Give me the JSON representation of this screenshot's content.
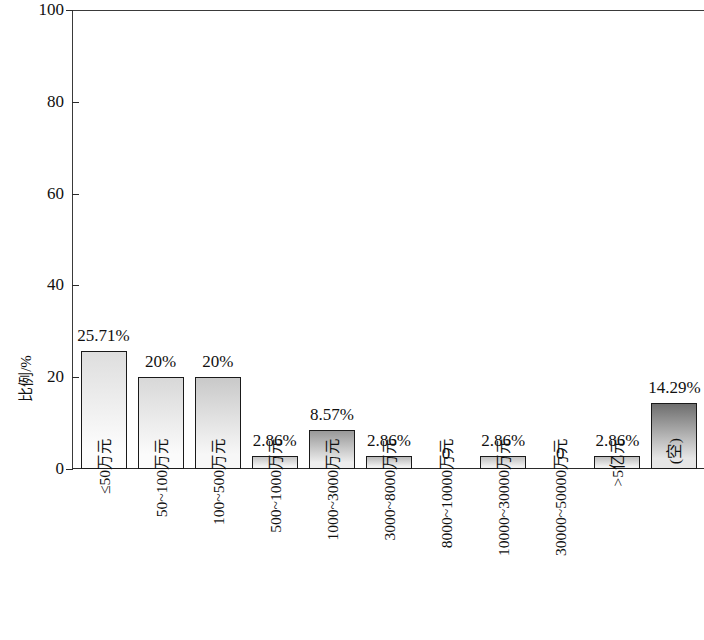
{
  "chart_data": {
    "type": "bar",
    "title": "",
    "xlabel": "",
    "ylabel": "比例/%",
    "ylim": [
      0,
      100
    ],
    "yticks": [
      0,
      20,
      40,
      60,
      80,
      100
    ],
    "grid": false,
    "legend": "none",
    "categories": [
      "≤50万元",
      "50~100万元",
      "100~500万元",
      "500~1000万元",
      "1000~3000万元",
      "3000~8000万元",
      "8000~10000万元",
      "10000~30000万元",
      "30000~50000万元",
      ">5亿元",
      "(空)"
    ],
    "values": [
      25.71,
      20,
      20,
      2.86,
      8.57,
      2.86,
      0,
      2.86,
      0,
      2.86,
      14.29
    ],
    "data_labels": [
      "25.71%",
      "20%",
      "20%",
      "2.86%",
      "8.57%",
      "2.86%",
      "0",
      "2.86%",
      "0",
      "2.86%",
      "14.29%"
    ]
  },
  "axis": {
    "y_title": "比例/%",
    "y_tick_labels": [
      "0",
      "20",
      "40",
      "60",
      "80",
      "100"
    ]
  },
  "colors": {
    "bar_border": "#1a1a1a",
    "axis": "#2a2a2a",
    "text": "#111111",
    "bar_fill_top": "#d9d9d9",
    "bar_fill_bottom": "#fbfbfb"
  }
}
